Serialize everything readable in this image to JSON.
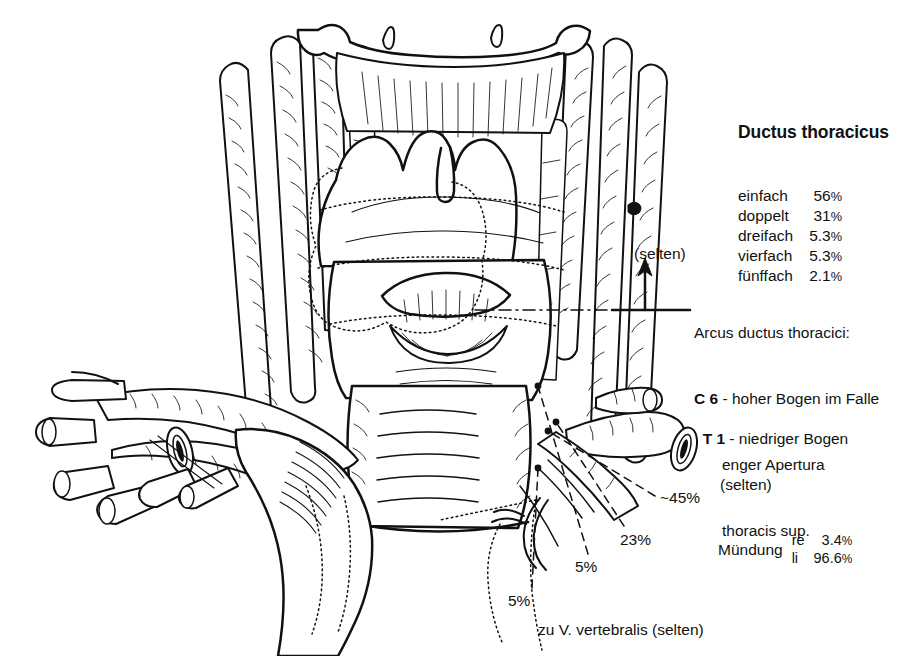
{
  "figure": {
    "kind": "anatomical-line-drawing",
    "ink_color": "#111111",
    "background_color": "#ffffff"
  },
  "legend": {
    "title": "Ductus thoracicus",
    "rows": [
      {
        "label": "einfach",
        "value": "56",
        "unit": "%"
      },
      {
        "label": "doppelt",
        "value": "31",
        "unit": "%"
      },
      {
        "label": "dreifach",
        "value": "5.3",
        "unit": "%"
      },
      {
        "label": "vierfach",
        "value": "5.3",
        "unit": "%"
      },
      {
        "label": "fünffach",
        "value": "2.1",
        "unit": "%"
      }
    ]
  },
  "arcus": {
    "arrow_note": "(selten)",
    "line1": "Arcus ductus thoracici:",
    "level": "C 6",
    "line2_rest": " - hoher Bogen im Falle",
    "line3": "enger Apertura",
    "line4": "thoracis sup."
  },
  "t1": {
    "level": "T 1",
    "rest": " - niedriger Bogen",
    "note": "(selten)"
  },
  "percent_labels": {
    "p45": "~45%",
    "p23": "23%",
    "p5_right": "5%",
    "p5_left": "5%"
  },
  "vertebralis": {
    "text": "zu V. vertebralis (selten)"
  },
  "muendung": {
    "word": "Mündung",
    "rows": [
      {
        "side": "re",
        "value": "3.4",
        "unit": "%"
      },
      {
        "side": "li",
        "value": "96.6",
        "unit": "%"
      }
    ]
  }
}
